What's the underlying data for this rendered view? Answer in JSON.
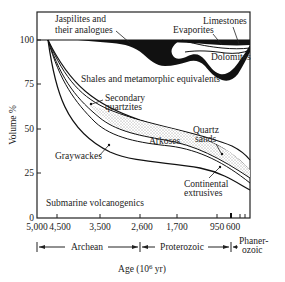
{
  "diagram": {
    "y_axis_label": "Volume %",
    "y_ticks": [
      "100",
      "75",
      "50",
      "25",
      "0"
    ],
    "x_ticks": [
      "5,000",
      "4,500",
      "3,500",
      "2,600",
      "1,700",
      "950",
      "600"
    ],
    "x_axis_label": "Age (10",
    "x_axis_label_sup": "6",
    "x_axis_label_end": " yr)",
    "eons": {
      "archean": "Archean",
      "proterozoic": "Proterozoic",
      "phanerozoic_1": "Phaner-",
      "phanerozoic_2": "ozoic"
    },
    "labels": {
      "jaspilites_1": "Jaspilites and",
      "jaspilites_2": "their analogues",
      "limestones": "Limestones",
      "evaporites": "Evaporites",
      "dolomites": "Dolomites",
      "shales": "Shales and metamorphic equivalents",
      "secondary_1": "Secondary",
      "secondary_2": "quartzites",
      "quartz_1": "Quartz",
      "quartz_2": "sands",
      "arkoses": "Arkoses",
      "graywackes": "Graywackes",
      "continental_1": "Continental",
      "continental_2": "extrusives",
      "submarine": "Submarine volcanogenics"
    }
  }
}
